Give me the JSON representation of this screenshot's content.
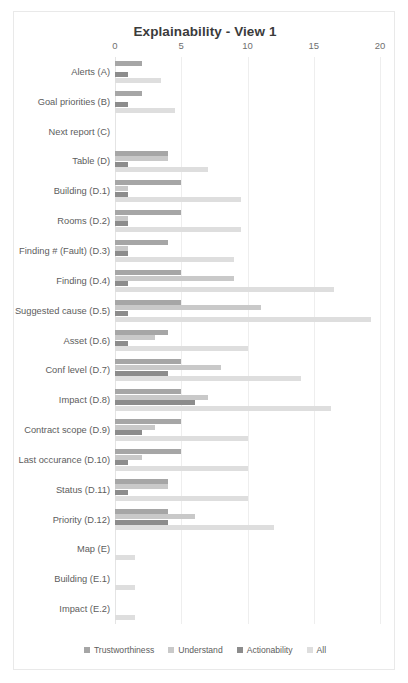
{
  "chart_data": {
    "type": "bar",
    "orientation": "horizontal",
    "title": "Explainability - View 1",
    "xlabel": "",
    "ylabel": "",
    "xlim": [
      0,
      20
    ],
    "xticks": [
      0,
      5,
      10,
      15,
      20
    ],
    "grid": true,
    "legend_position": "bottom",
    "categories": [
      "Alerts (A)",
      "Goal priorities (B)",
      "Next report (C)",
      "Table (D)",
      "Building (D.1)",
      "Rooms (D.2)",
      "Finding # (Fault) (D.3)",
      "Finding (D.4)",
      "Suggested cause (D.5)",
      "Asset (D.6)",
      "Conf level (D.7)",
      "Impact (D.8)",
      "Contract scope (D.9)",
      "Last occurance (D.10)",
      "Status (D.11)",
      "Priority (D.12)",
      "Map (E)",
      "Building (E.1)",
      "Impact (E.2)"
    ],
    "series": [
      {
        "name": "Trustworthiness",
        "color": "#a6a6a6",
        "values": [
          2,
          2,
          0,
          4,
          5,
          5,
          4,
          5,
          5,
          4,
          5,
          5,
          5,
          5,
          4,
          4,
          0,
          0,
          0
        ]
      },
      {
        "name": "Understand",
        "color": "#c9c9c9",
        "values": [
          0,
          0,
          0,
          4,
          1,
          1,
          1,
          9,
          11,
          3,
          8,
          7,
          3,
          2,
          4,
          6,
          0,
          0,
          0
        ]
      },
      {
        "name": "Actionability",
        "color": "#8c8c8c",
        "values": [
          1,
          1,
          0,
          1,
          1,
          1,
          1,
          1,
          1,
          1,
          4,
          6,
          2,
          1,
          1,
          4,
          0,
          0,
          0
        ]
      },
      {
        "name": "All",
        "color": "#dedede",
        "values": [
          3.5,
          4.5,
          0,
          7,
          9.5,
          9.5,
          9,
          16.5,
          19.3,
          10,
          14,
          16.3,
          10,
          10,
          10,
          12,
          1.5,
          1.5,
          1.5
        ]
      }
    ]
  }
}
